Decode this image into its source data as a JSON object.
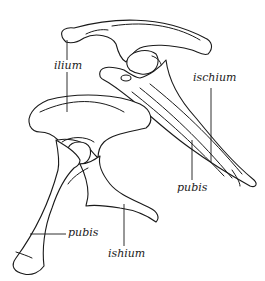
{
  "diagram": {
    "figures": [
      {
        "id": "upper",
        "labels": {
          "ilium": "ilium",
          "ischium": "ischium",
          "pubis": "pubis"
        }
      },
      {
        "id": "lower",
        "labels": {
          "pubis": "pubis",
          "ischium": "ishium"
        }
      }
    ],
    "colors": {
      "stroke": "#1a1a1a",
      "background": "#ffffff"
    }
  }
}
